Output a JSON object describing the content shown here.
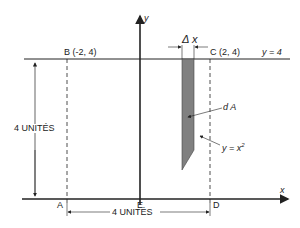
{
  "diagram": {
    "axis_y_label": "y",
    "axis_x_label": "x",
    "point_b": "B (-2, 4)",
    "point_c": "C (2, 4)",
    "line_label": "y = 4",
    "delta_x": "Δ x",
    "da_label": "d A",
    "curve_label_prefix": "y = x",
    "curve_label_exp": "2",
    "height_dim": "4 UNITÉS",
    "width_dim": "4 UNITÉS",
    "point_a": "A",
    "point_e": "E",
    "point_d": "D",
    "colors": {
      "line": "#222222",
      "strip_fill": "#808080"
    }
  }
}
